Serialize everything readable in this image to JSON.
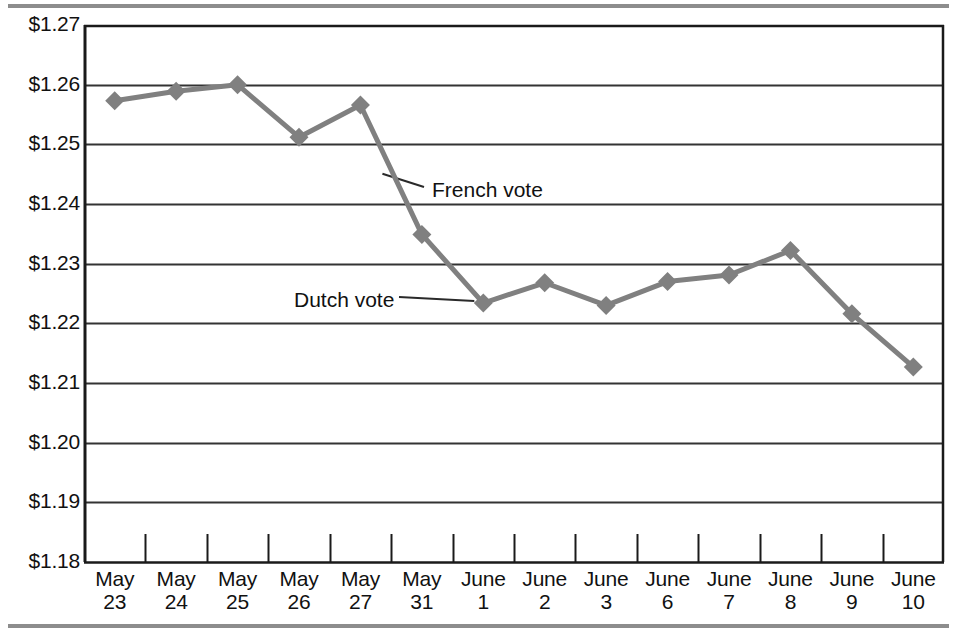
{
  "figure": {
    "background_color": "#ffffff",
    "rule_color": "#8d8d8d",
    "line_color": "#808080",
    "marker_color": "#808080",
    "axis_color": "#1a1a1a",
    "gridline_color": "#333333",
    "text_color": "#111111"
  },
  "chart_data": {
    "type": "line",
    "title": "",
    "subtitle": "",
    "xlabel": "",
    "ylabel": "",
    "grid": "horizontal",
    "legend": "none",
    "ylim": [
      1.18,
      1.27
    ],
    "ytick_step": 0.01,
    "ytick_labels": [
      "$1.27",
      "$1.26",
      "$1.25",
      "$1.24",
      "$1.23",
      "$1.22",
      "$1.21",
      "$1.20",
      "$1.19",
      "$1.18"
    ],
    "ytick_values": [
      1.27,
      1.26,
      1.25,
      1.24,
      1.23,
      1.22,
      1.21,
      1.2,
      1.19,
      1.18
    ],
    "categories": [
      "May 23",
      "May 24",
      "May 25",
      "May 26",
      "May 27",
      "May 31",
      "June 1",
      "June 2",
      "June 3",
      "June 6",
      "June 7",
      "June 8",
      "June 9",
      "June 10"
    ],
    "xtick_labels": [
      {
        "month": "May",
        "day": "23"
      },
      {
        "month": "May",
        "day": "24"
      },
      {
        "month": "May",
        "day": "25"
      },
      {
        "month": "May",
        "day": "26"
      },
      {
        "month": "May",
        "day": "27"
      },
      {
        "month": "May",
        "day": "31"
      },
      {
        "month": "June",
        "day": "1"
      },
      {
        "month": "June",
        "day": "2"
      },
      {
        "month": "June",
        "day": "3"
      },
      {
        "month": "June",
        "day": "6"
      },
      {
        "month": "June",
        "day": "7"
      },
      {
        "month": "June",
        "day": "8"
      },
      {
        "month": "June",
        "day": "9"
      },
      {
        "month": "June",
        "day": "10"
      }
    ],
    "series": [
      {
        "name": "Euro exchange rate",
        "marker": "diamond",
        "values": [
          1.2573,
          1.2589,
          1.26,
          1.2512,
          1.2566,
          1.2349,
          1.2234,
          1.2268,
          1.223,
          1.227,
          1.2281,
          1.2322,
          1.2216,
          1.2127
        ]
      }
    ],
    "annotations": [
      {
        "id": "french-vote",
        "text": "French vote",
        "target_category": "May 27",
        "x": 432,
        "y": 178
      },
      {
        "id": "dutch-vote",
        "text": "Dutch vote",
        "target_category": "June 1",
        "x": 294,
        "y": 288
      }
    ]
  }
}
